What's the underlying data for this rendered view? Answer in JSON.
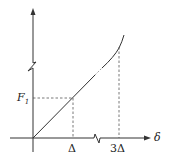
{
  "diagram": {
    "type": "force-displacement curve",
    "axes": {
      "x_label": "δ",
      "y_label": "",
      "x_break": true,
      "y_break": true
    },
    "labels": {
      "f1": "F",
      "f1_sub": "1",
      "delta": "Δ",
      "three_delta": "3Δ",
      "x_axis": "δ"
    },
    "curve": {
      "segments": [
        "linear from origin through (Δ, F1)",
        "dashed/faint transition",
        "stiffening curve up to beyond 3Δ"
      ]
    },
    "colors": {
      "line": "#333333",
      "dashed": "#555555"
    }
  }
}
